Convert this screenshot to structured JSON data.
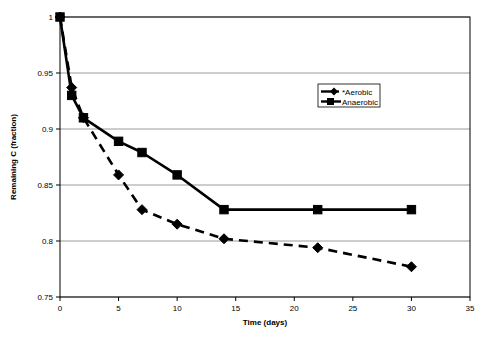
{
  "chart_data": {
    "type": "line",
    "title": "",
    "xlabel": "Time (days)",
    "ylabel": "Remaining C (fraction)",
    "xlim": [
      0,
      35
    ],
    "ylim": [
      0.75,
      1
    ],
    "xticks": [
      "0",
      "5",
      "10",
      "15",
      "20",
      "25",
      "30",
      "35"
    ],
    "xtick_values": [
      0,
      5,
      10,
      15,
      20,
      25,
      30,
      35
    ],
    "yticks": [
      "0.75",
      "0.8",
      "0.85",
      "0.9",
      "0.95",
      "1"
    ],
    "ytick_values": [
      0.75,
      0.8,
      0.85,
      0.9,
      0.95,
      1
    ],
    "grid": "horizontal",
    "legend_position": "upper-right-inside",
    "series": [
      {
        "name": "*Aerobic",
        "marker": "diamond",
        "linestyle": "dashed",
        "color": "#000000",
        "x": [
          0,
          1,
          2,
          5,
          7,
          10,
          14,
          22,
          30
        ],
        "values": [
          1.0,
          0.937,
          0.91,
          0.859,
          0.828,
          0.815,
          0.802,
          0.794,
          0.777
        ]
      },
      {
        "name": "Anaerobic",
        "marker": "square",
        "linestyle": "solid",
        "color": "#000000",
        "x": [
          0,
          1,
          2,
          5,
          7,
          10,
          14,
          22,
          30
        ],
        "values": [
          1.0,
          0.93,
          0.91,
          0.889,
          0.879,
          0.859,
          0.828,
          0.828,
          0.828
        ]
      }
    ]
  },
  "legend": {
    "entries": [
      {
        "label": "*Aerobic",
        "marker": "diamond-icon",
        "line": "solid"
      },
      {
        "label": "Anaerobic",
        "marker": "square-icon",
        "line": "solid"
      }
    ]
  }
}
